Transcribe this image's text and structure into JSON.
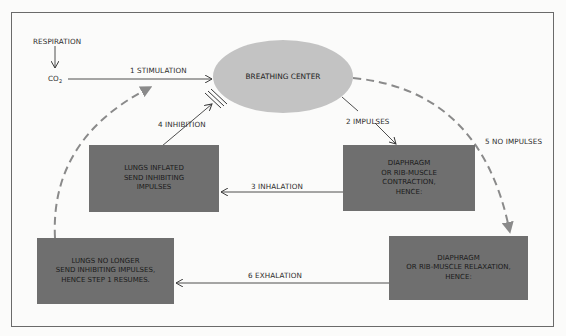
{
  "diagram": {
    "respiration_label": "RESPIRATION",
    "co2_label": "CO",
    "co2_subscript": "2",
    "center": {
      "label": "BREATHING CENTER",
      "color": "#c3c3c3"
    },
    "steps": [
      {
        "number": "1",
        "label": "STIMULATION"
      },
      {
        "number": "2",
        "label": "IMPULSES"
      },
      {
        "number": "3",
        "label": "INHALATION"
      },
      {
        "number": "4",
        "label": "INHIBITION"
      },
      {
        "number": "5",
        "label": "NO IMPULSES"
      },
      {
        "number": "6",
        "label": "EXHALATION"
      }
    ],
    "boxes": {
      "lungs_inflated": "LUNGS INFLATED\nSEND INHIBITING\nIMPULSES",
      "contraction": "DIAPHRAGM\nOR RIB-MUSCLE\nCONTRACTION,\nHENCE:",
      "lungs_no_longer": "LUNGS NO LONGER\nSEND INHIBITING IMPULSES,\nHENCE STEP 1 RESUMES.",
      "relaxation": "DIAPHRAGM\nOR RIB-MUSCLE RELAXATION,\nHENCE:"
    },
    "colors": {
      "box": "#6f6f6f",
      "dashed_arrow": "#8a8a8a",
      "line": "#3a3a3a"
    }
  }
}
